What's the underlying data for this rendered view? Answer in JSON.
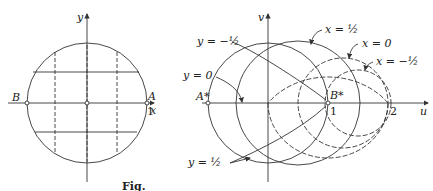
{
  "left": {
    "x_axis": "x",
    "y_axis": "y",
    "point_B": "B",
    "point_A": "A",
    "tick_1": "1"
  },
  "right": {
    "u_axis": "u",
    "v_axis": "v",
    "point_A_star": "A*",
    "point_B_star": "B*",
    "tick_1": "1",
    "tick_2": "2",
    "labels": {
      "y_neg_half": "y = −½",
      "y_zero": "y = 0",
      "y_half": "y = ½",
      "x_half": "x = ½",
      "x_zero": "x = 0",
      "x_neg_half": "x = −½"
    }
  },
  "caption": "Fig."
}
